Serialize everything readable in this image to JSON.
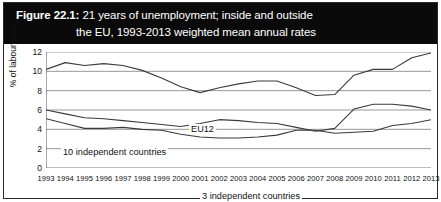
{
  "figure": {
    "label": "Figure 22.1:",
    "title_line1": "21 years of unemployment; inside and outside",
    "title_line2": "the EU, 1993-2013 weighted mean annual rates",
    "banner_color": "#0a0a0a",
    "banner_text_color": "#ffffff"
  },
  "chart_data": {
    "type": "line",
    "title": "Figure 22.1: 21 years of unemployment; inside and outside the EU, 1993-2013 weighted mean annual rates",
    "xlabel": "",
    "ylabel": "% of labour force",
    "ylim": [
      0,
      12
    ],
    "yticks": [
      0,
      2,
      4,
      6,
      8,
      10,
      12
    ],
    "grid": true,
    "legend_position": "inline-annotations",
    "x": [
      1993,
      1994,
      1995,
      1996,
      1997,
      1998,
      1999,
      2000,
      2001,
      2002,
      2003,
      2004,
      2005,
      2006,
      2007,
      2008,
      2009,
      2010,
      2011,
      2012,
      2013
    ],
    "xtick_labels": [
      "1993",
      "1994",
      "1995",
      "1996",
      "1997",
      "1998",
      "1999",
      "2000",
      "2001",
      "2002",
      "2003",
      "2004",
      "2005",
      "2006",
      "2007",
      "2008",
      "2009",
      "2010",
      "2011",
      "2012",
      "2013"
    ],
    "series": [
      {
        "name": "EU12",
        "annotation": "EU12",
        "color": "#3a3a3a",
        "values": [
          10.2,
          10.9,
          10.6,
          10.8,
          10.6,
          10.1,
          9.3,
          8.4,
          7.8,
          8.3,
          8.7,
          9.0,
          9.0,
          8.3,
          7.5,
          7.6,
          9.6,
          10.2,
          10.2,
          11.4,
          11.9
        ]
      },
      {
        "name": "10 independent countries",
        "annotation": "10 independent countries",
        "color": "#3a3a3a",
        "values": [
          6.0,
          5.6,
          5.2,
          5.1,
          4.9,
          4.7,
          4.5,
          4.3,
          4.6,
          5.0,
          4.9,
          4.7,
          4.6,
          4.2,
          3.8,
          4.1,
          6.1,
          6.6,
          6.6,
          6.4,
          6.0
        ]
      },
      {
        "name": "3 independent countries",
        "annotation": "3 independent countries",
        "color": "#3a3a3a",
        "values": [
          5.1,
          4.6,
          4.1,
          4.1,
          4.2,
          4.0,
          3.9,
          3.5,
          3.2,
          3.1,
          3.1,
          3.2,
          3.4,
          3.9,
          3.9,
          3.6,
          3.7,
          3.8,
          4.4,
          4.6,
          5.0
        ]
      }
    ]
  }
}
